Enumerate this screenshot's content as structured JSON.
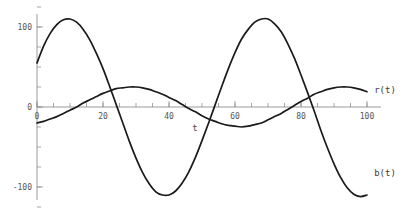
{
  "chart_data": {
    "type": "line",
    "title": "",
    "subtitle": "",
    "xlabel": "t",
    "ylabel": "",
    "xlim": [
      0,
      100
    ],
    "ylim": [
      -125,
      125
    ],
    "grid": false,
    "legend_position": "curve-end-labels",
    "x_ticks_major": [
      0,
      20,
      40,
      60,
      80,
      100
    ],
    "x_tick_labels": [
      "0",
      "20",
      "40",
      "60",
      "80",
      "100"
    ],
    "x_tick_minor_step": 5,
    "y_ticks_major": [
      -100,
      0,
      100
    ],
    "y_tick_labels": [
      "-100",
      "0",
      "100"
    ],
    "y_tick_minor_step": 25,
    "annotations": [
      {
        "text": "t",
        "x": 48,
        "y": -28,
        "name": "x-axis-name"
      }
    ],
    "series": [
      {
        "name": "b(t)",
        "label": "b(t)",
        "color": "#1a1a1a",
        "amplitude": 110,
        "period": 63.5,
        "phase_deg": 30,
        "offset": 0,
        "label_x": 100,
        "label_y": -95,
        "x": [
          0,
          2,
          4,
          6,
          8,
          10,
          12,
          14,
          16,
          18,
          20,
          22,
          24,
          26,
          28,
          30,
          32,
          34,
          36,
          38,
          40,
          42,
          44,
          46,
          48,
          50,
          52,
          54,
          56,
          58,
          60,
          62,
          64,
          66,
          68,
          70,
          72,
          74,
          76,
          78,
          80,
          82,
          84,
          86,
          88,
          90,
          92,
          94,
          96,
          98,
          100
        ],
        "y": [
          55,
          76,
          92,
          103,
          109,
          110,
          106,
          97,
          84,
          67,
          48,
          26,
          3,
          -20,
          -43,
          -64,
          -82,
          -96,
          -106,
          -110,
          -110,
          -105,
          -95,
          -81,
          -63,
          -42,
          -20,
          3,
          26,
          48,
          68,
          85,
          97,
          106,
          110,
          110,
          104,
          94,
          79,
          61,
          40,
          18,
          -5,
          -29,
          -51,
          -71,
          -88,
          -101,
          -109,
          -112,
          -110
        ]
      },
      {
        "name": "r(t)",
        "label": "r(t)",
        "color": "#1a1a1a",
        "amplitude": 25,
        "period": 62,
        "phase_deg": -105,
        "offset": 0,
        "label_x": 100,
        "label_y": 26,
        "x": [
          0,
          2,
          4,
          6,
          8,
          10,
          12,
          14,
          16,
          18,
          20,
          22,
          24,
          26,
          28,
          30,
          32,
          34,
          36,
          38,
          40,
          42,
          44,
          46,
          48,
          50,
          52,
          54,
          56,
          58,
          60,
          62,
          64,
          66,
          68,
          70,
          72,
          74,
          76,
          78,
          80,
          82,
          84,
          86,
          88,
          90,
          92,
          94,
          96,
          98,
          100
        ],
        "y": [
          -20,
          -18,
          -15,
          -12,
          -8,
          -4,
          0,
          5,
          9,
          13,
          17,
          20,
          23,
          24,
          25,
          25,
          24,
          22,
          19,
          16,
          12,
          8,
          3,
          -2,
          -6,
          -11,
          -15,
          -18,
          -21,
          -23,
          -24,
          -25,
          -24,
          -22,
          -20,
          -16,
          -12,
          -8,
          -3,
          2,
          7,
          11,
          16,
          19,
          22,
          24,
          25,
          25,
          24,
          22,
          19
        ]
      }
    ]
  },
  "labels": {
    "y_100": "100",
    "y_0": "0",
    "y_neg100": "-100",
    "x_0": "0",
    "x_20": "20",
    "x_40": "40",
    "x_60": "60",
    "x_80": "80",
    "x_100": "100",
    "x_axis_name": "t",
    "series_r": "r(t)",
    "series_b": "b(t)"
  },
  "colors": {
    "background": "#ffffff",
    "curve": "#1a1a1a",
    "axis": "#8f8f8f",
    "tick_text": "#555555"
  }
}
